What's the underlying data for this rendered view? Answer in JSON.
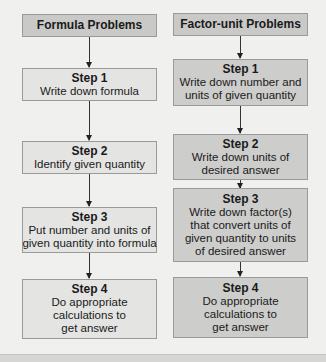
{
  "left": {
    "title": "Formula Problems",
    "steps": [
      {
        "label": "Step 1",
        "lines": [
          "Write down formula"
        ]
      },
      {
        "label": "Step 2",
        "lines": [
          "Identify given quantity"
        ]
      },
      {
        "label": "Step 3",
        "lines": [
          "Put number and units of",
          "given quantity into formula"
        ]
      },
      {
        "label": "Step 4",
        "lines": [
          "Do appropriate",
          "calculations to",
          "get answer"
        ]
      }
    ]
  },
  "right": {
    "title": "Factor-unit Problems",
    "steps": [
      {
        "label": "Step 1",
        "lines": [
          "Write down number and",
          "units of given quantity"
        ]
      },
      {
        "label": "Step 2",
        "lines": [
          "Write down units of",
          "desired answer"
        ]
      },
      {
        "label": "Step 3",
        "lines": [
          "Write down factor(s)",
          "that convert units of",
          "given quantity to units",
          "of desired answer"
        ]
      },
      {
        "label": "Step 4",
        "lines": [
          "Do appropriate",
          "calculations to",
          "get answer"
        ]
      }
    ]
  },
  "colors": {
    "title_fill": "#c9c9c8",
    "left_step_fill": "#e4e4e3",
    "right_step_fill": "#cdcdcc",
    "background": "#f0f0ef"
  }
}
